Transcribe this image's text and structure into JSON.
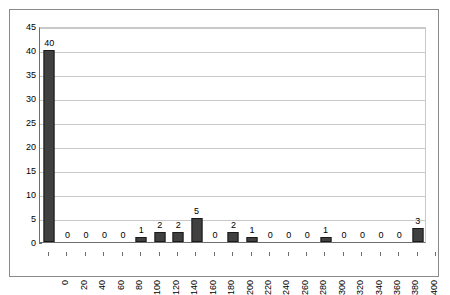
{
  "chart_data": {
    "type": "bar",
    "title": "",
    "subtitle": "",
    "xlabel": "",
    "ylabel": "",
    "categories": [
      "0",
      "20",
      "40",
      "60",
      "80",
      "100",
      "120",
      "140",
      "160",
      "180",
      "200",
      "220",
      "240",
      "260",
      "280",
      "300",
      "320",
      "340",
      "360",
      "380",
      "400"
    ],
    "values": [
      40,
      0,
      0,
      0,
      0,
      1,
      2,
      2,
      5,
      0,
      2,
      1,
      0,
      0,
      0,
      1,
      0,
      0,
      0,
      0,
      3
    ],
    "data_labels": [
      "40",
      "0",
      "0",
      "0",
      "0",
      "1",
      "2",
      "2",
      "5",
      "0",
      "2",
      "1",
      "0",
      "0",
      "0",
      "1",
      "0",
      "0",
      "0",
      "0",
      "3"
    ],
    "ylim": [
      0,
      45
    ],
    "ytick_step": 5,
    "yticks": [
      "0",
      "5",
      "10",
      "15",
      "20",
      "25",
      "30",
      "35",
      "40",
      "45"
    ],
    "grid": "horizontal",
    "legend": "none",
    "series": [
      {
        "name": "Series1",
        "values": [
          40,
          0,
          0,
          0,
          0,
          1,
          2,
          2,
          5,
          0,
          2,
          1,
          0,
          0,
          0,
          1,
          0,
          0,
          0,
          0,
          3
        ]
      }
    ],
    "colors": {
      "bar_fill": "#404040",
      "bar_border": "#1a1a1a",
      "gridline": "#c8c8c8",
      "axis": "#6e6e6e",
      "frame": "#8a8a8a",
      "plot_background": "#ffffff",
      "text": "#000000"
    },
    "x_label_rotation": 90
  }
}
